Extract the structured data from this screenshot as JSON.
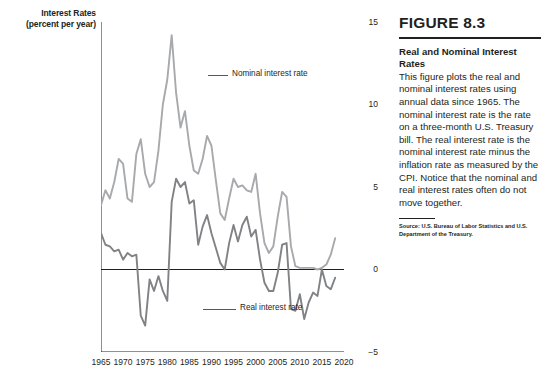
{
  "figure": {
    "number": "FIGURE 8.3",
    "title_line1": "Real and Nominal Interest",
    "title_line2": "Rates",
    "body": "This figure plots the real and nominal interest rates using annual data since 1965. The nominal interest rate is the rate on a three-month U.S. Treasury bill. The real interest rate is the nominal interest rate minus the inflation rate as measured by the CPI. Notice that the nominal and real interest rates often do not move together.",
    "source": "Source: U.S. Bureau of Labor Statistics and U.S.\nDepartment of the Treasury."
  },
  "axes": {
    "y_title_line1": "Interest Rates",
    "y_title_line2": "(percent per year)",
    "y_ticks": [
      15,
      10,
      5,
      0,
      -5
    ],
    "y_tick_labels": [
      "15",
      "10",
      "5",
      "0",
      "−5"
    ],
    "x_ticks": [
      1965,
      1970,
      1975,
      1980,
      1985,
      1990,
      1995,
      2000,
      2005,
      2010,
      2015,
      2020
    ],
    "x_tick_labels": [
      "1965",
      "1970",
      "1975",
      "1980",
      "1985",
      "1990",
      "1995",
      "2000",
      "2005",
      "2010",
      "2015",
      "2020"
    ]
  },
  "annotations": {
    "nominal_label": "Nominal interest rate",
    "real_label": "Real interest rate"
  },
  "colors": {
    "nominal": "#a7a9ac",
    "real": "#808285",
    "axis": "#231f20",
    "text": "#231f20"
  },
  "chart_data": {
    "type": "line",
    "title": "Real and Nominal Interest Rates",
    "xlabel": "",
    "ylabel": "Interest Rates (percent per year)",
    "xlim": [
      1965,
      2020
    ],
    "ylim": [
      -5,
      15
    ],
    "grid": false,
    "legend": "inline-annotation",
    "x": [
      1965,
      1966,
      1967,
      1968,
      1969,
      1970,
      1971,
      1972,
      1973,
      1974,
      1975,
      1976,
      1977,
      1978,
      1979,
      1980,
      1981,
      1982,
      1983,
      1984,
      1985,
      1986,
      1987,
      1988,
      1989,
      1990,
      1991,
      1992,
      1993,
      1994,
      1995,
      1996,
      1997,
      1998,
      1999,
      2000,
      2001,
      2002,
      2003,
      2004,
      2005,
      2006,
      2007,
      2008,
      2009,
      2010,
      2011,
      2012,
      2013,
      2014,
      2015,
      2016,
      2017,
      2018
    ],
    "series": [
      {
        "name": "Nominal interest rate",
        "color": "#a7a9ac",
        "values": [
          3.9,
          4.8,
          4.3,
          5.3,
          6.7,
          6.4,
          4.3,
          4.1,
          7.0,
          7.9,
          5.8,
          5.0,
          5.3,
          7.2,
          10.0,
          11.5,
          14.2,
          10.7,
          8.6,
          9.6,
          7.5,
          6.0,
          5.8,
          6.7,
          8.1,
          7.5,
          5.4,
          3.4,
          3.0,
          4.3,
          5.5,
          5.0,
          5.1,
          4.8,
          4.7,
          5.8,
          3.4,
          1.6,
          1.0,
          1.4,
          3.2,
          4.7,
          4.4,
          1.4,
          0.2,
          0.1,
          0.1,
          0.1,
          0.1,
          0.0,
          0.1,
          0.3,
          0.9,
          1.9
        ]
      },
      {
        "name": "Real interest rate",
        "color": "#808285",
        "values": [
          2.2,
          1.5,
          1.4,
          1.1,
          1.2,
          0.6,
          1.0,
          0.8,
          0.9,
          -2.8,
          -3.4,
          -0.6,
          -1.3,
          -0.4,
          -1.3,
          -1.9,
          4.1,
          5.5,
          5.0,
          5.3,
          4.0,
          4.2,
          1.5,
          2.6,
          3.3,
          2.2,
          1.3,
          0.4,
          0.0,
          1.6,
          2.7,
          1.7,
          2.7,
          3.2,
          2.0,
          2.4,
          0.6,
          -0.8,
          -1.3,
          -1.3,
          -0.2,
          1.5,
          1.6,
          -2.4,
          -2.5,
          -1.5,
          -3.0,
          -2.0,
          -1.4,
          -1.6,
          0.0,
          -1.0,
          -1.2,
          -0.5
        ]
      }
    ]
  }
}
